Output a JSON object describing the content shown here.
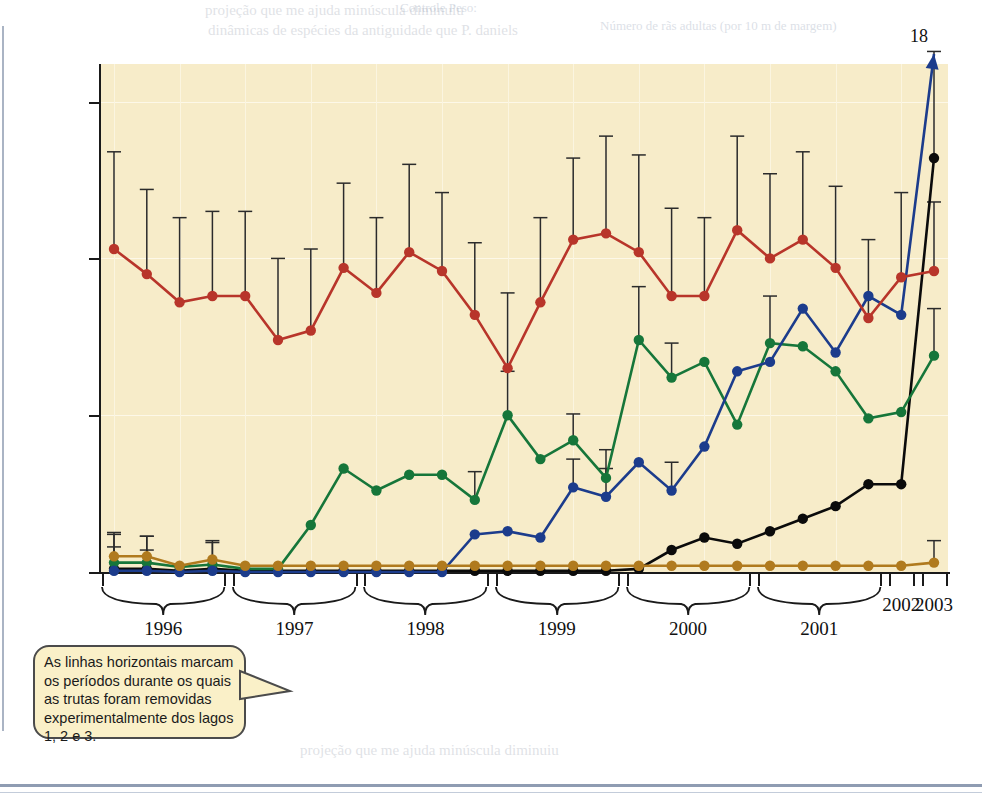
{
  "figure": {
    "y_axis": {
      "label": "Número de rãs adultas (por 10 m de margem)",
      "ticks": [
        "0,0",
        "2,5",
        "5,0",
        "7,5"
      ]
    },
    "x_axis": {
      "year_labels": [
        "1996",
        "1997",
        "1998",
        "1999",
        "2000",
        "2001",
        "2002",
        "2003"
      ]
    },
    "legend": {
      "items": [
        {
          "label": "Controle, peixes ausentes",
          "color": "#b8352a"
        },
        {
          "label": "Controle, peixes presentes",
          "color": "#b07a1e"
        },
        {
          "label": "Lago 1",
          "color": "#16763a"
        },
        {
          "label": "Lago 2",
          "color": "#1c3c8c"
        },
        {
          "label": "Lago 3",
          "color": "#0b0b0b"
        }
      ],
      "group_label": "Lagos de remoção"
    },
    "callout": {
      "text": "As linhas horizontais marcam os períodos durante os quais as trutas foram removidas experimentalmente dos lagos 1, 2 e 3."
    },
    "removal_bars": [
      {
        "label": "Lago 1",
        "color": "#16763a"
      },
      {
        "label": "Lago 2",
        "color": "#1c3c8c"
      },
      {
        "label": "Lago 3",
        "color": "#0b0b0b"
      }
    ],
    "offscale_annotation": "18"
  },
  "chart_data": {
    "type": "line",
    "title": "",
    "xlabel": "",
    "ylabel": "Número de rãs adultas (por 10 m de margem)",
    "ylim": [
      0,
      8.1
    ],
    "yticks": [
      0.0,
      2.5,
      5.0,
      7.5
    ],
    "grid": true,
    "legend_position": "top-left-inset",
    "x_year_groups": [
      {
        "year": "1996",
        "n_points": 4,
        "bracket": true
      },
      {
        "year": "1997",
        "n_points": 4,
        "bracket": true
      },
      {
        "year": "1998",
        "n_points": 4,
        "bracket": true
      },
      {
        "year": "1999",
        "n_points": 4,
        "bracket": true
      },
      {
        "year": "2000",
        "n_points": 4,
        "bracket": true
      },
      {
        "year": "2001",
        "n_points": 4,
        "bracket": true
      },
      {
        "year": "2002",
        "n_points": 1,
        "bracket": false
      },
      {
        "year": "2003",
        "n_points": 1,
        "bracket": false
      }
    ],
    "x": [
      1,
      2,
      3,
      4,
      5,
      6,
      7,
      8,
      9,
      10,
      11,
      12,
      13,
      14,
      15,
      16,
      17,
      18,
      19,
      20,
      21,
      22,
      23,
      24,
      25,
      26
    ],
    "series": [
      {
        "name": "Controle, peixes ausentes",
        "color": "#b8352a",
        "values": [
          5.15,
          4.75,
          4.3,
          4.4,
          4.4,
          3.7,
          3.85,
          4.85,
          4.45,
          5.1,
          4.8,
          4.1,
          3.25,
          4.3,
          5.3,
          5.4,
          5.1,
          4.4,
          4.4,
          5.45,
          5.0,
          5.3,
          4.85,
          4.05,
          4.7,
          4.8
        ],
        "errors_upper": [
          1.55,
          1.35,
          1.35,
          1.35,
          1.35,
          1.3,
          1.3,
          1.35,
          1.2,
          1.4,
          1.25,
          1.15,
          1.2,
          1.35,
          1.3,
          1.55,
          1.55,
          1.4,
          1.25,
          1.5,
          1.35,
          1.4,
          1.3,
          1.25,
          1.35,
          1.1
        ]
      },
      {
        "name": "Controle, peixes presentes",
        "color": "#b07a1e",
        "values": [
          0.25,
          0.25,
          0.1,
          0.2,
          0.1,
          0.1,
          0.1,
          0.1,
          0.1,
          0.1,
          0.1,
          0.1,
          0.1,
          0.1,
          0.1,
          0.1,
          0.1,
          0.1,
          0.1,
          0.1,
          0.1,
          0.1,
          0.1,
          0.1,
          0.1,
          0.15
        ],
        "errors_upper": [
          0.38,
          0.32,
          0.0,
          0.3,
          0.0,
          0.0,
          0.0,
          0.0,
          0.0,
          0.0,
          0.0,
          0.0,
          0.0,
          0.0,
          0.0,
          0.0,
          0.0,
          0.0,
          0.0,
          0.0,
          0.0,
          0.0,
          0.0,
          0.0,
          0.0,
          0.35
        ]
      },
      {
        "name": "Lago 1",
        "color": "#16763a",
        "values": [
          0.15,
          0.15,
          0.08,
          0.12,
          0.05,
          0.05,
          0.75,
          1.65,
          1.3,
          1.55,
          1.55,
          1.15,
          2.5,
          1.8,
          2.1,
          1.5,
          3.7,
          3.1,
          3.35,
          2.35,
          3.65,
          3.6,
          3.2,
          2.45,
          2.55,
          3.45
        ],
        "errors_upper": [
          0.45,
          0.42,
          0.0,
          0.35,
          0.0,
          0.0,
          0.0,
          0.0,
          0.0,
          0.0,
          0.0,
          0.45,
          0.7,
          0.0,
          0.42,
          0.45,
          0.85,
          0.55,
          0.0,
          0.0,
          0.75,
          0.0,
          0.0,
          0.0,
          0.0,
          0.75
        ]
      },
      {
        "name": "Lago 2",
        "color": "#1c3c8c",
        "values": [
          0.02,
          0.02,
          0.0,
          0.02,
          0.0,
          0.0,
          0.0,
          0.0,
          0.0,
          0.0,
          0.0,
          0.6,
          0.65,
          0.55,
          1.35,
          1.2,
          1.75,
          1.3,
          2.0,
          3.2,
          3.35,
          4.2,
          3.5,
          4.4,
          4.1,
          18.0
        ],
        "errors_upper": [
          0.0,
          0.0,
          0.0,
          0.0,
          0.0,
          0.0,
          0.0,
          0.0,
          0.0,
          0.0,
          0.0,
          0.0,
          0.0,
          0.0,
          0.45,
          0.45,
          0.0,
          0.45,
          0.0,
          0.0,
          0.0,
          0.0,
          0.0,
          0.0,
          0.0,
          0.0
        ],
        "offscale_last": true,
        "offscale_label": "18"
      },
      {
        "name": "Lago 3",
        "color": "#0b0b0b",
        "values": [
          0.05,
          0.05,
          0.02,
          0.05,
          0.02,
          0.02,
          0.02,
          0.02,
          0.02,
          0.02,
          0.02,
          0.02,
          0.02,
          0.02,
          0.02,
          0.02,
          0.05,
          0.35,
          0.55,
          0.45,
          0.65,
          0.85,
          1.05,
          1.4,
          1.4,
          6.6
        ],
        "errors_upper": [
          0.35,
          0.3,
          0.0,
          0.0,
          0.0,
          0.0,
          0.0,
          0.0,
          0.0,
          0.0,
          0.0,
          0.0,
          0.0,
          0.0,
          0.0,
          0.0,
          0.0,
          0.0,
          0.0,
          0.0,
          0.0,
          0.0,
          0.0,
          0.0,
          0.0,
          1.7
        ]
      }
    ],
    "removal_periods": [
      {
        "lake": "Lago 1",
        "color": "#16763a",
        "x_start": 5.3,
        "x_end": 14.2,
        "arrow": false
      },
      {
        "lake": "Lago 2",
        "color": "#1c3c8c",
        "x_start": 9.0,
        "x_end": 20.0,
        "arrow": false
      },
      {
        "lake": "Lago 3",
        "color": "#0b0b0b",
        "x_start": 14.8,
        "x_end": 26.0,
        "arrow": true
      }
    ]
  },
  "bleed_text": {
    "lines": [
      "projeção que me ajuda minúscula diminuiu",
      "dinâmicas de espécies da antiguidade que P. daniels",
      "Controle Peso:",
      "Número de rãs adultas (por 10 m de margem)",
      "observa a maior população maiores os ranhos",
      "Análise de Dados",
      "contêm fato das, em vez disso, o de",
      "podem variar de um lugar",
      "a incidência de maneira",
      "os estudos não contêm"
    ]
  }
}
